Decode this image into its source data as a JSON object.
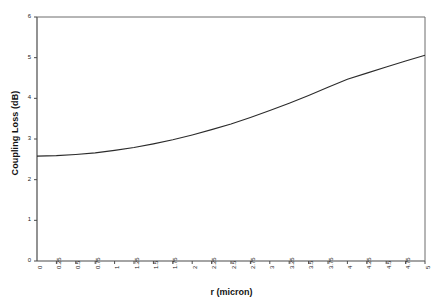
{
  "chart_data": {
    "type": "line",
    "title": "",
    "xlabel": "r (micron)",
    "ylabel": "Coupling Loss (dB)",
    "xlim": [
      0,
      5
    ],
    "ylim": [
      0,
      6
    ],
    "grid": false,
    "legend": null,
    "xticks": [
      "0",
      "0.25",
      "0.5",
      "0.75",
      "1",
      "1.25",
      "1.5",
      "1.75",
      "2",
      "2.25",
      "2.5",
      "2.75",
      "3",
      "3.25",
      "3.5",
      "3.75",
      "4",
      "4.25",
      "4.5",
      "4.75",
      "5"
    ],
    "yticks": [
      "0",
      "1",
      "2",
      "3",
      "4",
      "5",
      "6"
    ],
    "series": [
      {
        "name": "Coupling Loss",
        "color": "#2b2b2b",
        "x": [
          0,
          0.25,
          0.5,
          0.75,
          1,
          1.25,
          1.5,
          1.75,
          2,
          2.25,
          2.5,
          2.75,
          3,
          3.25,
          3.5,
          3.75,
          4,
          4.25,
          4.5,
          4.75,
          5
        ],
        "values": [
          2.58,
          2.59,
          2.62,
          2.66,
          2.72,
          2.79,
          2.88,
          2.98,
          3.1,
          3.23,
          3.37,
          3.53,
          3.7,
          3.88,
          4.07,
          4.27,
          4.47,
          4.62,
          4.77,
          4.92,
          5.06
        ]
      }
    ]
  },
  "axis": {
    "x_title": "r (micron)",
    "y_title": "Coupling Loss (dB)"
  }
}
